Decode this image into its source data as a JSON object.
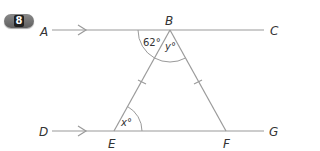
{
  "question": {
    "number": "8"
  },
  "diagram": {
    "points": {
      "A": "A",
      "B": "B",
      "C": "C",
      "D": "D",
      "E": "E",
      "F": "F",
      "G": "G"
    },
    "angles": {
      "ABE": "62°",
      "EBF": "y°",
      "BEF": "x°"
    },
    "colors": {
      "line": "#9a9a9a",
      "text": "#333333",
      "badge": "#6e6e6e"
    },
    "notes": {
      "parallel_lines": "AC ∥ DG (arrow marks)",
      "equal_sides": "BE = BF (tick marks)"
    }
  }
}
